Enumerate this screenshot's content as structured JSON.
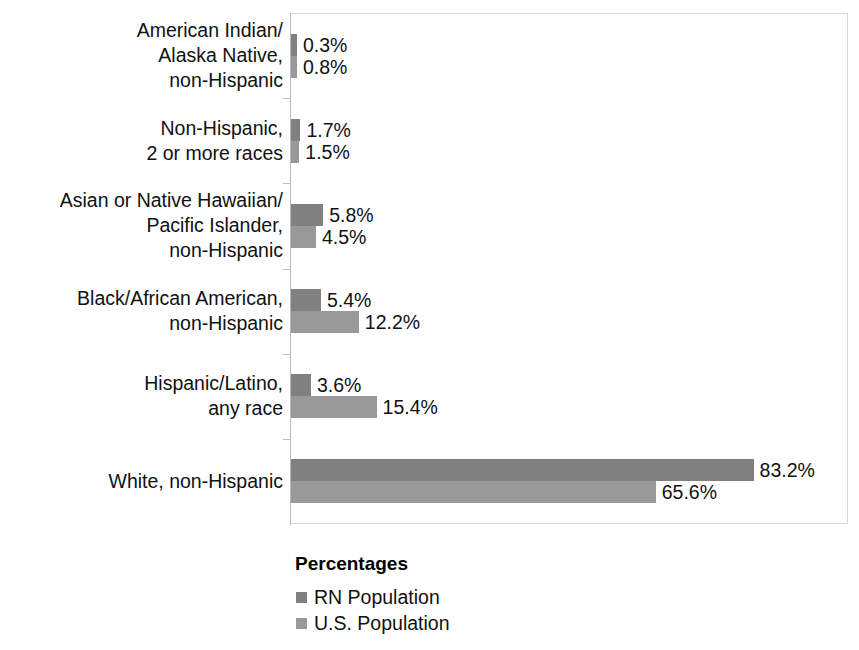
{
  "chart_data": {
    "type": "bar",
    "orientation": "horizontal",
    "title": "",
    "xlabel": "Percentages",
    "ylabel": "",
    "xlim": [
      0,
      100
    ],
    "grid": false,
    "legend_position": "bottom-left",
    "legend_title": "Percentages",
    "categories": [
      "American Indian/\nAlaska Native,\nnon-Hispanic",
      "Non-Hispanic,\n2 or more races",
      "Asian or Native Hawaiian/\nPacific Islander,\nnon-Hispanic",
      "Black/African American,\nnon-Hispanic",
      "Hispanic/Latino,\nany race",
      "White, non-Hispanic"
    ],
    "series": [
      {
        "name": "RN Population",
        "color": "#808080",
        "values": [
          0.3,
          1.7,
          5.8,
          5.4,
          3.6,
          83.2
        ],
        "labels": [
          "0.3%",
          "1.7%",
          "5.8%",
          "5.4%",
          "3.6%",
          "83.2%"
        ]
      },
      {
        "name": "U.S. Population",
        "color": "#999999",
        "values": [
          0.8,
          1.5,
          4.5,
          12.2,
          15.4,
          65.6
        ],
        "labels": [
          "0.8%",
          "1.5%",
          "4.5%",
          "12.2%",
          "15.4%",
          "65.6%"
        ]
      }
    ]
  },
  "legend": {
    "title": "Percentages",
    "items": [
      {
        "label": "RN Population",
        "color": "#808080"
      },
      {
        "label": "U.S. Population",
        "color": "#999999"
      }
    ]
  }
}
